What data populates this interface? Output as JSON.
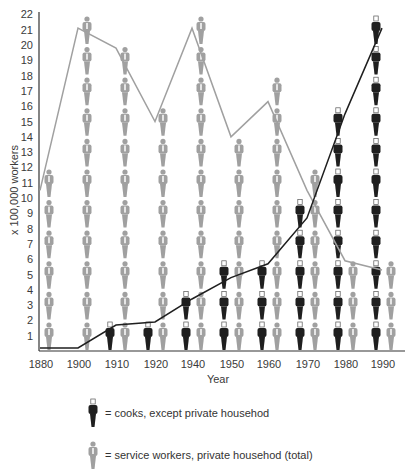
{
  "chart_data": {
    "type": "line",
    "title": "",
    "xlabel": "Year",
    "ylabel": "x 100,000 workers",
    "ylim": [
      0,
      22
    ],
    "y_ticks": [
      1,
      2,
      3,
      4,
      5,
      6,
      7,
      8,
      9,
      10,
      11,
      12,
      13,
      14,
      15,
      16,
      17,
      18,
      19,
      20,
      21,
      22
    ],
    "categories": [
      "1880",
      "1900",
      "1910",
      "1920",
      "1940",
      "1950",
      "1960",
      "1970",
      "1980",
      "1990"
    ],
    "series": [
      {
        "name": "cooks, except private househod",
        "color": "#1f1f1f",
        "style": "pictogram (dark figures) + black line",
        "values": [
          0.2,
          0.2,
          1.7,
          1.9,
          3.4,
          4.8,
          5.7,
          8.7,
          15.5,
          21.1
        ]
      },
      {
        "name": "service workers, private househod (total)",
        "color": "#a0a0a0",
        "style": "pictogram (grey figures) + grey line",
        "values": [
          10.5,
          21.1,
          19.8,
          15.0,
          21.1,
          14.0,
          16.3,
          10.5,
          5.9,
          5.3
        ]
      }
    ],
    "grid": false,
    "legend_position": "bottom"
  },
  "legend": {
    "items": [
      {
        "icon": "dark-person-icon",
        "label": "= cooks, except private househod"
      },
      {
        "icon": "grey-person-icon",
        "label": "= service workers, private househod (total)"
      }
    ]
  }
}
